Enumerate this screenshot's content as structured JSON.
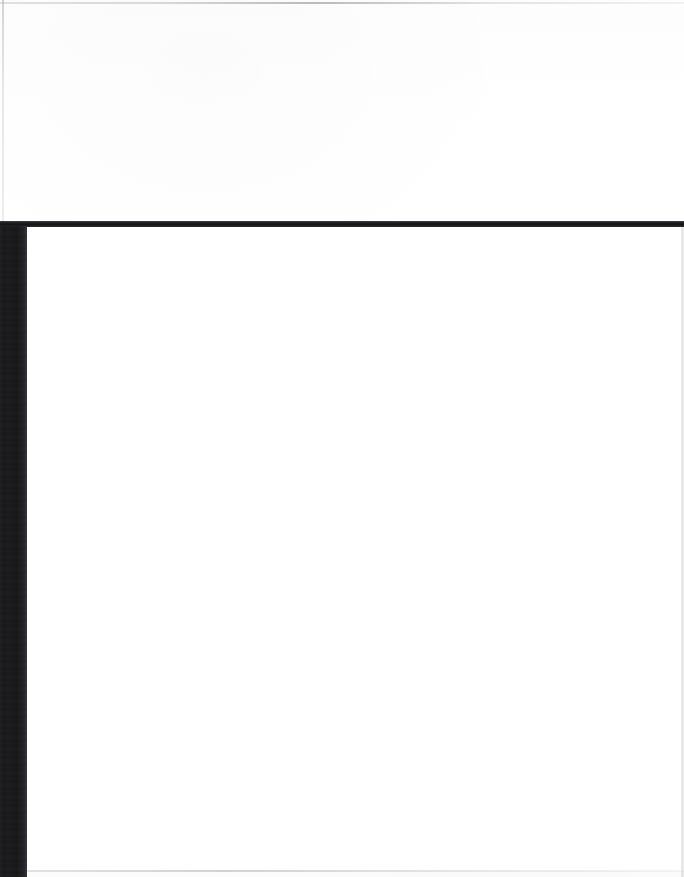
{
  "document": {
    "title": "Untitled Scanned Page",
    "page_label": "",
    "body_text": "",
    "header_text": "",
    "footer_text": ""
  },
  "page": {
    "width_px": 684,
    "height_px": 877,
    "background_color": "#ffffff",
    "orientation": "portrait",
    "content_state": "blank",
    "blank_notice": "This page is intentionally blank."
  },
  "regions": {
    "upper_field": {
      "name": "upper blank field",
      "text": "",
      "x": 0,
      "y": 0,
      "width": 684,
      "height": 221,
      "fill": "#ffffff"
    },
    "content_area": {
      "name": "main blank content area",
      "text": "",
      "x": 27,
      "y": 227,
      "width": 657,
      "height": 644,
      "fill": "#ffffff"
    }
  },
  "rules": {
    "frame_top": {
      "name": "horizontal frame rule",
      "color": "#1a1a1c",
      "x": 0,
      "y": 221,
      "width": 684,
      "height": 6
    },
    "frame_left": {
      "name": "vertical frame band",
      "color": "#18181a",
      "x": 0,
      "y": 226,
      "width": 27,
      "height": 651
    },
    "edge_top": {
      "name": "scan edge line top",
      "color": "#9b9da1",
      "x": 0,
      "y": 2,
      "width": 684,
      "height": 2
    },
    "edge_left": {
      "name": "scan edge line left",
      "color": "#a2a4a8",
      "x": 2,
      "y": 0,
      "width": 2,
      "height": 222
    },
    "edge_right": {
      "name": "scan edge line right",
      "color": "#b0b2b6",
      "x": 681,
      "y": 227,
      "width": 3,
      "height": 650
    },
    "edge_bottom": {
      "name": "scan edge line bottom",
      "color": "#a8aaae",
      "x": 27,
      "y": 870,
      "width": 657,
      "height": 2
    }
  },
  "colors": {
    "paper": "#ffffff",
    "ink_dark": "#18181a",
    "ink_rule": "#1a1a1c",
    "edge_gray": "#a8aaae"
  }
}
